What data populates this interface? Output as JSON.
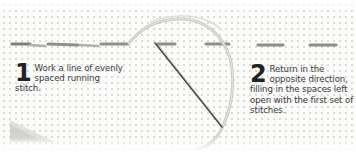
{
  "illustration": {
    "subject": "running stitch (double running stitch) tutorial",
    "fabric_color": "#fbfbfa",
    "grid_dot_color": "#d9d9d6",
    "stitch_color": "#8e8e8c",
    "thread_color": "#c8c8c6",
    "needle_color": "#4a4a4a",
    "icons": [
      "fabric-texture",
      "running-stitch-row",
      "thread-loop-icon",
      "needle-icon"
    ]
  },
  "steps": [
    {
      "number": "1",
      "text": "Work a line of evenly spaced running stitch."
    },
    {
      "number": "2",
      "text": "Return in the opposite direction, filling in the spaces left open with the first set of stitches."
    }
  ]
}
